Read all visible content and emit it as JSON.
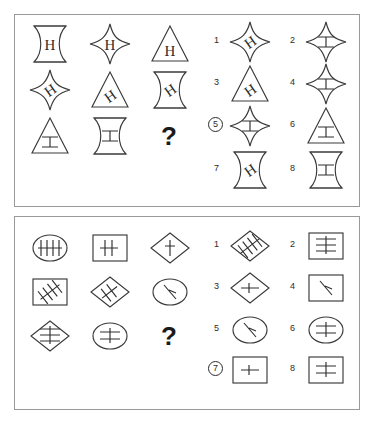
{
  "document": {
    "kind": "matrix-reasoning-test",
    "panel_count": 2,
    "background_color": "#ffffff",
    "ink_color": "#3a3a3a",
    "border_color": "#9a9a9a"
  },
  "panels": [
    {
      "id": "panel-1",
      "question_mark": "?",
      "matrix": {
        "rows": 3,
        "cols": 3,
        "cells": [
          {
            "index": 0,
            "outline": "hourglass",
            "glyph": "H-upright",
            "label": "hourglass-with-upright-H"
          },
          {
            "index": 1,
            "outline": "four-point-star",
            "glyph": "H-upright",
            "label": "star-with-upright-H"
          },
          {
            "index": 2,
            "outline": "triangle",
            "glyph": "H-upright",
            "label": "triangle-with-upright-H"
          },
          {
            "index": 3,
            "outline": "four-point-star",
            "glyph": "H-tilted",
            "label": "star-with-tilted-H"
          },
          {
            "index": 4,
            "outline": "triangle",
            "glyph": "H-tilted",
            "label": "triangle-with-tilted-H"
          },
          {
            "index": 5,
            "outline": "hourglass",
            "glyph": "H-tilted",
            "label": "hourglass-with-tilted-H"
          },
          {
            "index": 6,
            "outline": "triangle",
            "glyph": "H-rotated",
            "label": "triangle-with-rotated-H"
          },
          {
            "index": 7,
            "outline": "hourglass",
            "glyph": "H-rotated",
            "label": "hourglass-with-rotated-H"
          },
          {
            "index": 8,
            "outline": "none",
            "glyph": "question",
            "label": "missing-cell"
          }
        ]
      },
      "options": [
        {
          "number": "1",
          "outline": "four-point-star",
          "glyph": "H-tilted",
          "selected": false,
          "label": "star-with-tilted-H"
        },
        {
          "number": "2",
          "outline": "four-point-star",
          "glyph": "H-rotated",
          "selected": false,
          "label": "star-with-rotated-H"
        },
        {
          "number": "3",
          "outline": "triangle",
          "glyph": "H-tilted",
          "selected": false,
          "label": "triangle-with-tilted-H"
        },
        {
          "number": "4",
          "outline": "four-point-star",
          "glyph": "H-rotated",
          "selected": false,
          "label": "star-with-rotated-H-alt"
        },
        {
          "number": "5",
          "outline": "four-point-star",
          "glyph": "H-rotated",
          "selected": true,
          "label": "star-with-rotated-H-selected"
        },
        {
          "number": "6",
          "outline": "triangle",
          "glyph": "H-rotated",
          "selected": false,
          "label": "triangle-with-rotated-H"
        },
        {
          "number": "7",
          "outline": "hourglass",
          "glyph": "H-tilted",
          "selected": false,
          "label": "hourglass-with-tilted-H"
        },
        {
          "number": "8",
          "outline": "hourglass",
          "glyph": "H-rotated",
          "selected": false,
          "label": "hourglass-with-rotated-H"
        }
      ]
    },
    {
      "id": "panel-2",
      "question_mark": "?",
      "matrix": {
        "rows": 3,
        "cols": 3,
        "cells": [
          {
            "index": 0,
            "outline": "ellipse",
            "glyph": "three-vertical-strokes",
            "label": "ellipse-three-vertical"
          },
          {
            "index": 1,
            "outline": "square",
            "glyph": "two-vertical-strokes",
            "label": "square-two-vertical"
          },
          {
            "index": 2,
            "outline": "diamond",
            "glyph": "one-vertical-stroke",
            "label": "diamond-one-vertical"
          },
          {
            "index": 3,
            "outline": "square",
            "glyph": "three-diagonal-strokes",
            "label": "square-three-diagonal"
          },
          {
            "index": 4,
            "outline": "diamond",
            "glyph": "two-diagonal-strokes",
            "label": "diamond-two-diagonal"
          },
          {
            "index": 5,
            "outline": "ellipse",
            "glyph": "one-diagonal-stroke",
            "label": "ellipse-one-diagonal"
          },
          {
            "index": 6,
            "outline": "diamond",
            "glyph": "three-horizontal-strokes",
            "label": "diamond-three-horizontal"
          },
          {
            "index": 7,
            "outline": "ellipse",
            "glyph": "two-horizontal-strokes",
            "label": "ellipse-two-horizontal"
          },
          {
            "index": 8,
            "outline": "none",
            "glyph": "question",
            "label": "missing-cell"
          }
        ]
      },
      "options": [
        {
          "number": "1",
          "outline": "diamond",
          "glyph": "three-diagonal-strokes",
          "selected": false,
          "label": "diamond-three-diagonal"
        },
        {
          "number": "2",
          "outline": "square",
          "glyph": "three-horizontal-strokes",
          "selected": false,
          "label": "square-three-horizontal"
        },
        {
          "number": "3",
          "outline": "diamond",
          "glyph": "one-horizontal-stroke",
          "selected": false,
          "label": "diamond-one-horizontal"
        },
        {
          "number": "4",
          "outline": "square",
          "glyph": "one-diagonal-stroke",
          "selected": false,
          "label": "square-one-diagonal"
        },
        {
          "number": "5",
          "outline": "ellipse",
          "glyph": "one-diagonal-stroke",
          "selected": false,
          "label": "ellipse-one-diagonal"
        },
        {
          "number": "6",
          "outline": "ellipse",
          "glyph": "two-horizontal-strokes",
          "selected": false,
          "label": "ellipse-two-horizontal"
        },
        {
          "number": "7",
          "outline": "square",
          "glyph": "one-horizontal-stroke",
          "selected": true,
          "label": "square-one-horizontal-selected"
        },
        {
          "number": "8",
          "outline": "square",
          "glyph": "two-horizontal-strokes",
          "selected": false,
          "label": "square-two-horizontal"
        }
      ]
    }
  ]
}
